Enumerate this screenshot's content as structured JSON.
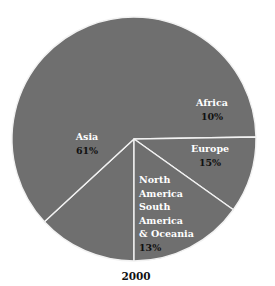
{
  "chart_data": {
    "type": "pie",
    "title": "2000",
    "start_angle_deg": 180,
    "direction": "clockwise",
    "slices": [
      {
        "label": [
          "North",
          "America",
          "South",
          "America",
          "& Oceania"
        ],
        "value": 13,
        "value_label": "13%",
        "label_align": "left"
      },
      {
        "label": [
          "Asia"
        ],
        "value": 61,
        "value_label": "61%",
        "label_align": "center"
      },
      {
        "label": [
          "Africa"
        ],
        "value": 10,
        "value_label": "10%",
        "label_align": "center"
      },
      {
        "label": [
          "Europe"
        ],
        "value": 15,
        "value_label": "15%",
        "label_align": "center"
      }
    ],
    "colors": {
      "fill": "#6f6f6f",
      "separator": "#f2f2f2",
      "name_text": "#ffffff",
      "value_text": "#111111"
    }
  }
}
